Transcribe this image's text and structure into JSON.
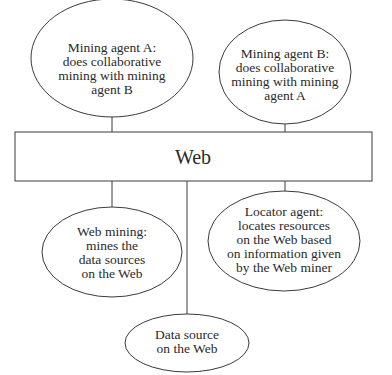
{
  "diagram": {
    "web_box": {
      "label": "Web"
    },
    "nodes": [
      {
        "id": "mining-agent-a",
        "lines": [
          "Mining agent A:",
          "does collaborative",
          "mining with mining",
          "agent B"
        ]
      },
      {
        "id": "mining-agent-b",
        "lines": [
          "Mining agent B:",
          "does collaborative",
          "mining with mining",
          "agent A"
        ]
      },
      {
        "id": "web-mining",
        "lines": [
          "Web mining:",
          "mines the",
          "data sources",
          "on the Web"
        ]
      },
      {
        "id": "locator-agent",
        "lines": [
          "Locator agent:",
          "locates resources",
          "on the Web based",
          "on information given",
          "by the Web miner"
        ]
      },
      {
        "id": "data-source",
        "lines": [
          "Data source",
          "on the Web"
        ]
      }
    ],
    "colors": {
      "stroke": "#3a3a3a",
      "text": "#2a2a2a",
      "background": "#ffffff"
    }
  }
}
